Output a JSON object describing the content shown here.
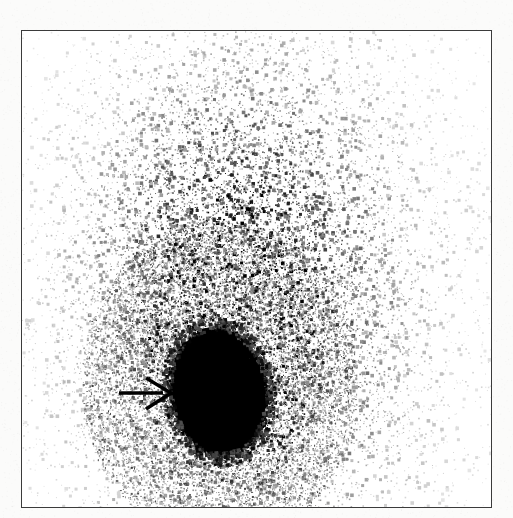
{
  "figure": {
    "kind": "scintigraphy-scan",
    "modality": "planar nuclear medicine scintigram",
    "title": "",
    "caption": "",
    "width_px": 513,
    "height_px": 518,
    "background_color": "#fbfbfa",
    "frame": {
      "x": 21,
      "y": 30,
      "width": 471,
      "height": 478,
      "border_color": "#3b3b3b",
      "border_width_px": 1.4,
      "fill_color": "#ffffff"
    }
  },
  "image_content": {
    "colormap": "inverted-grayscale",
    "max_intensity_color": "#000000",
    "min_intensity_color": "#ffffff",
    "hot_spot": {
      "label": "focal uptake",
      "center_x": 218,
      "center_y": 391,
      "radius_x": 46,
      "radius_y": 61,
      "rotation_deg": -8,
      "color": "#000000"
    },
    "diffuse_uptake": {
      "label": "diffuse background activity",
      "plume_center_x": 250,
      "plume_center_y": 300,
      "plume_radius_x": 165,
      "plume_radius_y": 250,
      "peak_density": 0.92,
      "speckle_color": "#4a4a4a"
    },
    "noise": {
      "seed": 20240517,
      "point_count": 46000,
      "point_size_min": 1,
      "point_size_max": 3
    }
  },
  "annotations": {
    "arrow": {
      "name": "pointer-arrow",
      "description": "black arrow pointing right at the focal hot spot",
      "color": "#000000",
      "shaft_x1": 119,
      "shaft_x2": 163,
      "shaft_y": 393,
      "tip_x": 171,
      "tip_y": 393,
      "head_top_x": 146,
      "head_top_y": 378,
      "head_bottom_x": 146,
      "head_bottom_y": 409,
      "line_width_px": 3.4
    }
  }
}
